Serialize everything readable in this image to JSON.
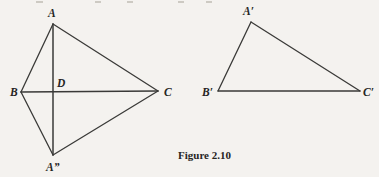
{
  "page": {
    "background_color": "#f4f2ef",
    "ink_color": "#3a3a38",
    "label_color": "#26251f"
  },
  "caption": {
    "text": "Figure 2.10",
    "x": 178,
    "y": 159
  },
  "figures": [
    {
      "id": "kite-figure",
      "name": "left-kite-diagram",
      "points": {
        "A": {
          "label": "A",
          "x": 53,
          "y": 24,
          "label_x": 48,
          "label_y": 17
        },
        "B": {
          "label": "B",
          "x": 21,
          "y": 92,
          "label_x": 10,
          "label_y": 96
        },
        "C": {
          "label": "C",
          "x": 158,
          "y": 91,
          "label_x": 164,
          "label_y": 96
        },
        "D": {
          "label": "D",
          "x": 53,
          "y": 91,
          "label_x": 57,
          "label_y": 87
        },
        "A2": {
          "label": "A”",
          "x": 53,
          "y": 155,
          "label_x": 46,
          "label_y": 171
        }
      },
      "segments": [
        {
          "name": "segment-A-B",
          "from": "A",
          "to": "B"
        },
        {
          "name": "segment-A-C",
          "from": "A",
          "to": "C"
        },
        {
          "name": "segment-B-A2",
          "from": "B",
          "to": "A2"
        },
        {
          "name": "segment-A2-C",
          "from": "A2",
          "to": "C"
        },
        {
          "name": "segment-B-C",
          "from": "B",
          "to": "C"
        },
        {
          "name": "segment-A-A2",
          "from": "A",
          "to": "A2"
        }
      ]
    },
    {
      "id": "triangle-figure",
      "name": "right-triangle-diagram",
      "points": {
        "Ap": {
          "label": "A′",
          "x": 251,
          "y": 22,
          "label_x": 243,
          "label_y": 15
        },
        "Bp": {
          "label": "B′",
          "x": 218,
          "y": 91,
          "label_x": 202,
          "label_y": 96
        },
        "Cp": {
          "label": "C′",
          "x": 360,
          "y": 91,
          "label_x": 363,
          "label_y": 96
        }
      },
      "segments": [
        {
          "name": "segment-Ap-Bp",
          "from": "Ap",
          "to": "Bp"
        },
        {
          "name": "segment-Ap-Cp",
          "from": "Ap",
          "to": "Cp"
        },
        {
          "name": "segment-Bp-Cp",
          "from": "Bp",
          "to": "Cp"
        }
      ]
    }
  ],
  "scan_artifacts": [
    {
      "x": 36,
      "y": 1,
      "w": 7,
      "h": 2
    },
    {
      "x": 95,
      "y": 1,
      "w": 6,
      "h": 2
    },
    {
      "x": 127,
      "y": 1,
      "w": 6,
      "h": 2
    },
    {
      "x": 178,
      "y": 1,
      "w": 6,
      "h": 2
    },
    {
      "x": 206,
      "y": 1,
      "w": 6,
      "h": 2
    }
  ]
}
